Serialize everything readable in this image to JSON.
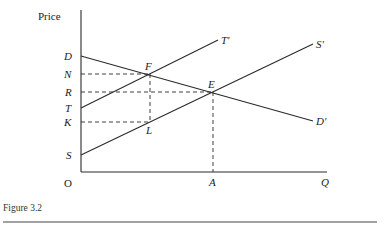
{
  "figure": {
    "caption": "Figure 3.2",
    "axes": {
      "y_label": "Price",
      "x_label": "Q",
      "origin_label": "O"
    },
    "y_tick_labels": {
      "D": "D",
      "N": "N",
      "R": "R",
      "T": "T",
      "K": "K",
      "S": "S"
    },
    "x_tick_labels": {
      "A": "A"
    },
    "curves": [
      {
        "name": "demand",
        "start_label": "D",
        "end_label": "D'"
      },
      {
        "name": "supply-shifted",
        "start_label": "T",
        "end_label": "T'"
      },
      {
        "name": "supply",
        "start_label": "S",
        "end_label": "S'"
      }
    ],
    "points": {
      "F": "F",
      "E": "E",
      "L": "L"
    },
    "line_end_labels": {
      "T_prime": "T'",
      "S_prime": "S'",
      "D_prime": "D'"
    }
  }
}
